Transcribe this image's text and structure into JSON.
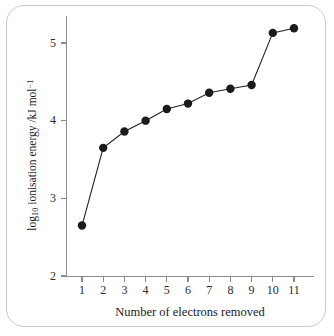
{
  "chart_data": {
    "type": "line",
    "title": "",
    "subtitle": "",
    "xlabel": "Number of electrons removed",
    "ylabel": "log10 ionisation energy /kJ mol-1",
    "ylabel_parts": {
      "prefix": "log",
      "sub": "10",
      "middle": " ionisation energy /kJ mol",
      "sup": "−1"
    },
    "x": [
      1,
      2,
      3,
      4,
      5,
      6,
      7,
      8,
      9,
      10,
      11
    ],
    "values": [
      2.65,
      3.65,
      3.86,
      4.0,
      4.15,
      4.22,
      4.36,
      4.41,
      4.46,
      5.13,
      5.19
    ],
    "categories": [
      "1",
      "2",
      "3",
      "4",
      "5",
      "6",
      "7",
      "8",
      "9",
      "10",
      "11"
    ],
    "xtick_labels": [
      "1",
      "2",
      "3",
      "4",
      "5",
      "6",
      "7",
      "8",
      "9",
      "10",
      "11"
    ],
    "ytick_labels": [
      "2",
      "3",
      "4",
      "5"
    ],
    "yticks": [
      2,
      3,
      4,
      5
    ],
    "xlim": [
      0.5,
      11.5
    ],
    "ylim": [
      2,
      5.45
    ],
    "grid": false,
    "legend": false,
    "legend_position": "none",
    "marker": "filled-circle",
    "marker_color": "#1b1b1b",
    "line_color": "#222222",
    "axis_color": "#8a8a8a",
    "frame_color": "#c9c9c9",
    "background": "#ffffff"
  }
}
